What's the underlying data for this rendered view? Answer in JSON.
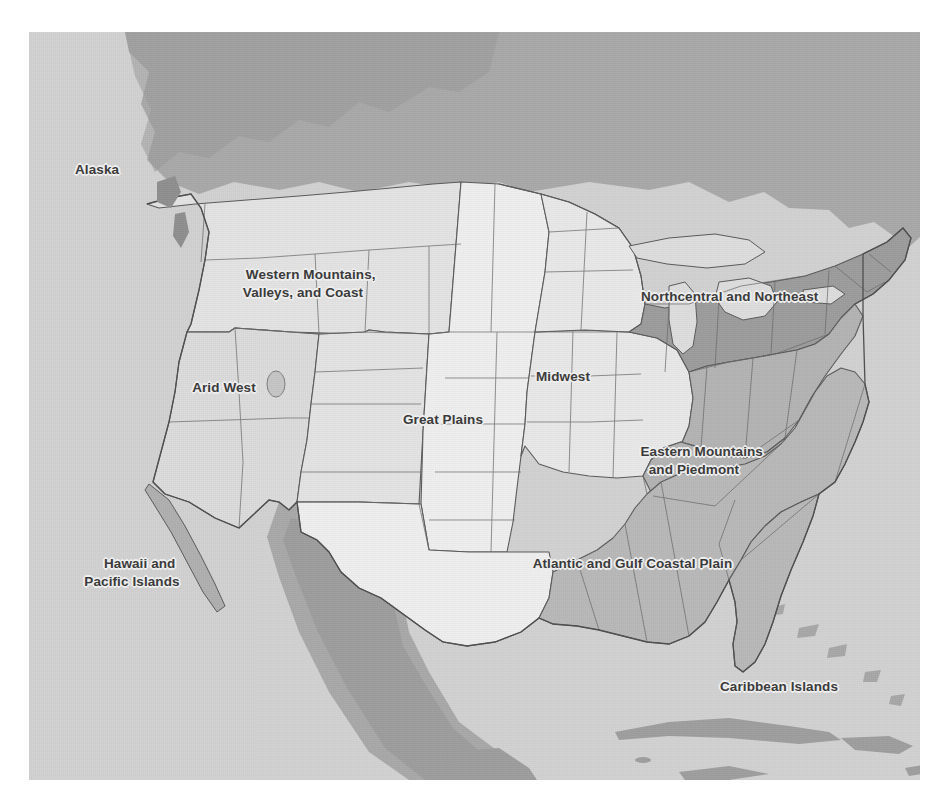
{
  "figure": {
    "kind": "regional-map",
    "background_color": "#ffffff",
    "ocean_color": "#d2d2d2",
    "outside_us_land_color": "#b0b0b0",
    "border_color": "#5a5a5a",
    "label_text_color": "#3b3b3b",
    "label_halo_color": "#eeeeee"
  },
  "regions": [
    {
      "id": "alaska",
      "label": "Alaska",
      "lines": [
        "Alaska"
      ],
      "fill": "#c9c9c9",
      "x": 75,
      "y": 168,
      "align": "left"
    },
    {
      "id": "western-mountains-valleys-and-coast",
      "label": "Western Mountains, Valleys, and Coast",
      "lines": [
        "Western Mountains,",
        "Valleys, and Coast"
      ],
      "fill": "#e4e4e4",
      "x": 303,
      "y": 249,
      "align": "center"
    },
    {
      "id": "arid-west",
      "label": "Arid West",
      "lines": [
        "Arid West"
      ],
      "fill": "#dcdcdc",
      "x": 224,
      "y": 386,
      "align": "center"
    },
    {
      "id": "great-plains",
      "label": "Great Plains",
      "lines": [
        "Great Plains"
      ],
      "fill": "#efefef",
      "x": 443,
      "y": 418,
      "align": "center"
    },
    {
      "id": "midwest",
      "label": "Midwest",
      "lines": [
        "Midwest"
      ],
      "fill": "#e9e9e9",
      "x": 563,
      "y": 375,
      "align": "center"
    },
    {
      "id": "northcentral-and-northeast",
      "label": "Northcentral and Northeast",
      "lines": [
        "Northcentral and Northeast"
      ],
      "fill": "#9d9d9d",
      "x": 722,
      "y": 278,
      "align": "center"
    },
    {
      "id": "eastern-mountains-and-piedmont",
      "label": "Eastern Mountains and Piedmont",
      "lines": [
        "Eastern Mountains",
        "and Piedmont"
      ],
      "fill": "#b4b4b4",
      "x": 692,
      "y": 443,
      "align": "center"
    },
    {
      "id": "atlantic-and-gulf-coastal-plain",
      "label": "Atlantic and Gulf Coastal Plain",
      "lines": [
        "Atlantic and Gulf Coastal Plain"
      ],
      "fill": "#b9b9b9",
      "x": 625,
      "y": 546,
      "align": "center"
    },
    {
      "id": "hawaii-and-pacific-islands",
      "label": "Hawaii and Pacific Islands",
      "lines": [
        "Hawaii and",
        "Pacific Islands"
      ],
      "fill": "#c9c9c9",
      "x": 130,
      "y": 554,
      "align": "center"
    },
    {
      "id": "caribbean-islands",
      "label": "Caribbean Islands",
      "lines": [
        "Caribbean Islands"
      ],
      "fill": "#c9c9c9",
      "x": 779,
      "y": 685,
      "align": "center"
    }
  ]
}
